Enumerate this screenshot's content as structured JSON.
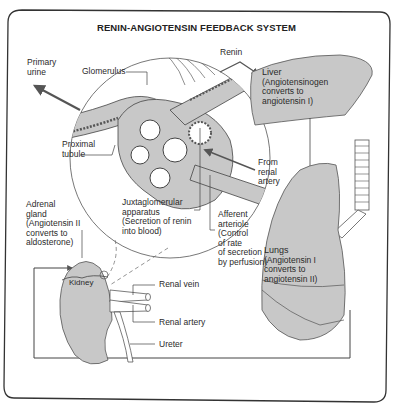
{
  "title": "RENIN-ANGIOTENSIN FEEDBACK SYSTEM",
  "labels": {
    "primary_urine": [
      "Primary",
      "urine"
    ],
    "glomerulus": "Glomerulus",
    "renin": "Renin",
    "proximal_tubule": [
      "Proximal",
      "tubule"
    ],
    "from_renal_artery": [
      "From",
      "renal",
      "artery"
    ],
    "juxtaglomerular": [
      "Juxtaglomerular",
      "apparatus"
    ],
    "juxtaglomerular_note": [
      "(Secretion of renin",
      "into blood)"
    ],
    "afferent_arteriole": [
      "Afferent",
      "arteriole"
    ],
    "afferent_note": [
      "(Control",
      "of rate",
      "of secretion",
      "by perfusion)"
    ],
    "adrenal_gland": [
      "Adrenal",
      "gland"
    ],
    "adrenal_note": [
      "(Angiotensin II",
      "converts to",
      "aldosterone)"
    ],
    "kidney": "Kidney",
    "renal_vein": "Renal vein",
    "renal_artery": "Renal artery",
    "ureter": "Ureter",
    "liver": "Liver",
    "liver_note": [
      "(Angiotensinogen",
      "converts to",
      "angiotensin I)"
    ],
    "lungs": "Lungs",
    "lungs_note": [
      "(Angiotensin I",
      "converts to",
      "angiotensin II)"
    ]
  },
  "colors": {
    "organ_fill": "#c8c8c8",
    "line": "#3a3a3a",
    "arrow": "#555555"
  }
}
